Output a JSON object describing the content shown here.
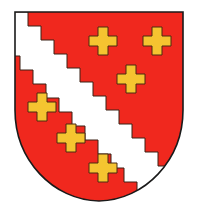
{
  "emblem": {
    "title": "Coat of arms",
    "field_color": "#f0281e",
    "bend_color": "#ffffff",
    "charge_color": "#f5c430",
    "outline_color": "#2a1a10",
    "bend": "white bend dancetty (stepped) from dexter chief to sinister base",
    "charges": [
      {
        "name": "cross-1",
        "cx": 103,
        "cy": 41
      },
      {
        "name": "cross-2",
        "cx": 157,
        "cy": 41
      },
      {
        "name": "cross-3",
        "cx": 131,
        "cy": 79
      },
      {
        "name": "cross-4",
        "cx": 42,
        "cy": 107
      },
      {
        "name": "cross-5",
        "cx": 71,
        "cy": 138
      },
      {
        "name": "cross-6",
        "cx": 103,
        "cy": 168
      }
    ]
  }
}
